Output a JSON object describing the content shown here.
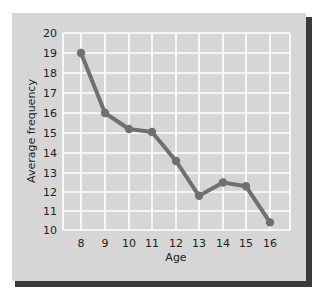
{
  "chart_data": {
    "type": "line",
    "title": "",
    "xlabel": "Age",
    "ylabel": "Average frequency",
    "x": [
      8,
      9,
      10,
      11,
      12,
      13,
      14,
      15,
      16
    ],
    "series": [
      {
        "name": "Average frequency",
        "values": [
          19,
          16,
          15.2,
          15.05,
          13.6,
          11.8,
          12.5,
          12.3,
          10.4
        ]
      }
    ],
    "xticks": [
      "8",
      "9",
      "10",
      "11",
      "12",
      "13",
      "14",
      "15",
      "16"
    ],
    "yticks": [
      "10",
      "11",
      "12",
      "13",
      "14",
      "15",
      "16",
      "17",
      "18",
      "19",
      "20"
    ],
    "ylim": [
      10,
      20
    ],
    "xlim": [
      7.25,
      16.85
    ],
    "grid": true,
    "legend": null
  },
  "style": {
    "frame_color": "#d6d6d6",
    "shadow_color": "#3a3a3a",
    "grid_color": "#ffffff",
    "line_color": "#707070",
    "text_color": "#222222"
  },
  "layout": {
    "frame": {
      "x": 12,
      "y": 13,
      "w": 294,
      "h": 268
    },
    "plot": {
      "left": 63,
      "right": 290,
      "top": 33,
      "bottom": 230
    },
    "x_pixels": [
      81,
      105,
      129,
      152,
      176,
      199,
      223,
      246,
      270
    ],
    "y_gridline_pixels": {
      "10": 230,
      "11": 211,
      "12": 192,
      "13": 173,
      "14": 153,
      "15": 133,
      "16": 113,
      "17": 93,
      "18": 73,
      "19": 53,
      "20": 33
    }
  }
}
